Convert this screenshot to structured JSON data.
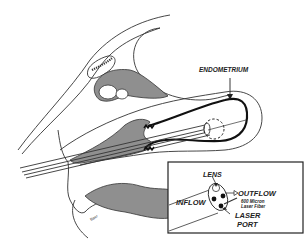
{
  "diagram": {
    "type": "medical-illustration",
    "labels": {
      "endometrium": "ENDOMETRIUM",
      "lens": "LENS",
      "outflow": "OUTFLOW",
      "inflow": "INFLOW",
      "fiber_line1": "600 Micron",
      "fiber_line2": "Laser Fiber",
      "laser_port_line1": "LASER",
      "laser_port_line2": "PORT",
      "signature": "Bacr"
    },
    "colors": {
      "background": "#ffffff",
      "line": "#333333",
      "tissue_fill": "#8f8f8f",
      "endometrium_line": "#111111"
    },
    "inset": {
      "title": "Hysteroscope tip detail",
      "components": [
        "LENS",
        "OUTFLOW",
        "INFLOW",
        "600 Micron Laser Fiber",
        "LASER PORT"
      ]
    }
  }
}
